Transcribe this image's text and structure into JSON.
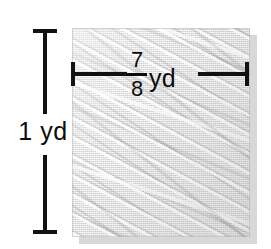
{
  "figure": {
    "type": "geometry-dimension-diagram",
    "vertical_dimension": {
      "label": "1 yd",
      "value": "1",
      "unit": "yd"
    },
    "horizontal_dimension": {
      "numerator": "7",
      "denominator": "8",
      "unit": "yd",
      "label": "7/8 yd"
    },
    "swatch": {
      "fill_color": "#e6e6e6",
      "shadow_color": "#d8d8d8",
      "texture": "diagonal-woven-fabric"
    },
    "line_color": "#121212"
  }
}
